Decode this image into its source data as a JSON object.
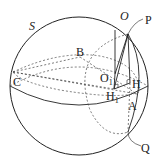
{
  "diagram": {
    "sphere_label": "S",
    "points": {
      "O": "O",
      "P": "P",
      "B": "B",
      "C": "C",
      "O1": "O",
      "O1_sub": "1",
      "H": "H",
      "H1": "H",
      "H1_sub": "1",
      "A": "A",
      "Q": "Q"
    },
    "colors": {
      "stroke": "#222222",
      "background": "#ffffff"
    }
  }
}
